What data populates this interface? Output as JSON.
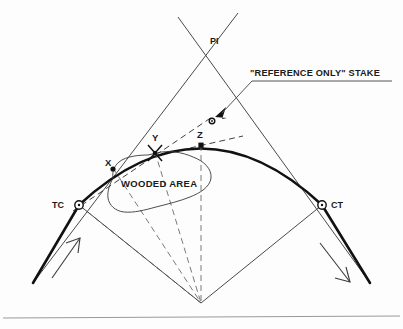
{
  "figure": {
    "labels": {
      "pi": "PI",
      "tc": "TC",
      "ct": "CT",
      "point_x": "X",
      "point_y": "Y",
      "point_z": "Z",
      "wooded_area": "WOODED AREA",
      "reference_stake": "\"REFERENCE ONLY\" STAKE"
    },
    "colors": {
      "background": "#fdfdfd",
      "curve": "#111111",
      "tangent": "#4a4a4a",
      "dashed": "#6b6b6b",
      "text": "#1a1a1a",
      "footer_rule": "#9a9a9a"
    },
    "geometry": {
      "pi": [
        201,
        30
      ],
      "tc": [
        79,
        205
      ],
      "ct": [
        322,
        205
      ],
      "radius_point": [
        201,
        303
      ],
      "curve_apex": [
        205,
        148
      ],
      "point_x": [
        113,
        168
      ],
      "point_y": [
        155,
        152
      ],
      "point_z": [
        201,
        145
      ],
      "stake": [
        212,
        117
      ]
    },
    "markers": {
      "tc_type": "circle-ring",
      "ct_type": "circle-ring",
      "x_type": "filled-dot",
      "y_type": "cross",
      "z_type": "filled-square",
      "stake_type": "small-ring-with-arrow"
    },
    "direction_arrows": {
      "left": "up-right",
      "right": "down-right"
    }
  }
}
